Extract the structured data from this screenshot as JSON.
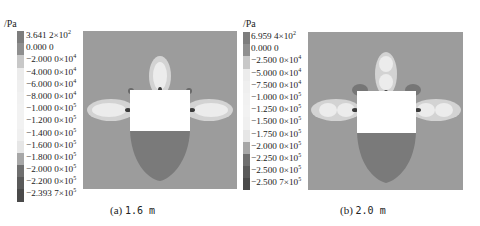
{
  "chart_data": [
    {
      "type": "heatmap",
      "title": "(a) 1.6 m",
      "caption_label": "(a)",
      "caption_value": "1.6 m",
      "unit": "/Pa",
      "legend_position": "left",
      "legend": [
        {
          "mantissa": "3.641 2",
          "exp": "2",
          "sci": true
        },
        {
          "mantissa": "0.000 0",
          "exp": null,
          "sci": false
        },
        {
          "mantissa": "−2.000 0",
          "exp": "4",
          "sci": true
        },
        {
          "mantissa": "−4.000 0",
          "exp": "4",
          "sci": true
        },
        {
          "mantissa": "−6.000 0",
          "exp": "4",
          "sci": true
        },
        {
          "mantissa": "−8.000 0",
          "exp": "4",
          "sci": true
        },
        {
          "mantissa": "−1.000 0",
          "exp": "5",
          "sci": true
        },
        {
          "mantissa": "−1.200 0",
          "exp": "5",
          "sci": true
        },
        {
          "mantissa": "−1.400 0",
          "exp": "5",
          "sci": true
        },
        {
          "mantissa": "−1.600 0",
          "exp": "5",
          "sci": true
        },
        {
          "mantissa": "−1.800 0",
          "exp": "5",
          "sci": true
        },
        {
          "mantissa": "−2.000 0",
          "exp": "5",
          "sci": true
        },
        {
          "mantissa": "−2.200 0",
          "exp": "5",
          "sci": true
        },
        {
          "mantissa": "−2.393 7",
          "exp": "5",
          "sci": true
        }
      ],
      "values_pa": [
        364.12,
        0,
        -20000,
        -40000,
        -60000,
        -80000,
        -100000,
        -120000,
        -140000,
        -160000,
        -180000,
        -200000,
        -220000,
        -239370
      ],
      "range": [
        -239370,
        364.12
      ]
    },
    {
      "type": "heatmap",
      "title": "(b) 2.0 m",
      "caption_label": "(b)",
      "caption_value": "2.0 m",
      "unit": "/Pa",
      "legend_position": "left",
      "legend": [
        {
          "mantissa": "6.959 4",
          "exp": "2",
          "sci": true
        },
        {
          "mantissa": "0.000 0",
          "exp": null,
          "sci": false
        },
        {
          "mantissa": "−2.500 0",
          "exp": "4",
          "sci": true
        },
        {
          "mantissa": "−5.000 0",
          "exp": "4",
          "sci": true
        },
        {
          "mantissa": "−7.500 0",
          "exp": "4",
          "sci": true
        },
        {
          "mantissa": "−1.000 0",
          "exp": "5",
          "sci": true
        },
        {
          "mantissa": "−1.250 0",
          "exp": "5",
          "sci": true
        },
        {
          "mantissa": "−1.500 0",
          "exp": "5",
          "sci": true
        },
        {
          "mantissa": "−1.750 0",
          "exp": "5",
          "sci": true
        },
        {
          "mantissa": "−2.000 0",
          "exp": "5",
          "sci": true
        },
        {
          "mantissa": "−2.250 0",
          "exp": "5",
          "sci": true
        },
        {
          "mantissa": "−2.500 0",
          "exp": "5",
          "sci": true
        },
        {
          "mantissa": "−2.500 7",
          "exp": "5",
          "sci": true
        }
      ],
      "values_pa": [
        695.94,
        0,
        -25000,
        -50000,
        -75000,
        -100000,
        -125000,
        -150000,
        -175000,
        -200000,
        -225000,
        -250000,
        -250070
      ],
      "range": [
        -250070,
        695.94
      ]
    }
  ],
  "colors": {
    "background_field": "#9c9c9c",
    "opening": "#ffffff",
    "lower_zone": "#7a7a7a",
    "plume_light": "#e8e8e8",
    "plume_mid": "#cfcfcf",
    "dark_core": "#3a3a3a",
    "cbar_a": [
      "#7d7d7d",
      "#8f8f8f",
      "#c8c8c8",
      "#ececec",
      "#efefef",
      "#f1f1f1",
      "#f2f2f2",
      "#f2f2f2",
      "#f0f0f0",
      "#e6e6e6",
      "#a7a7a7",
      "#6f6f6f",
      "#5a5a5a",
      "#4a4a4a"
    ],
    "cbar_b": [
      "#7d7d7d",
      "#8f8f8f",
      "#c8c8c8",
      "#ececec",
      "#efefef",
      "#f1f1f1",
      "#f2f2f2",
      "#f0f0f0",
      "#e6e6e6",
      "#a7a7a7",
      "#6f6f6f",
      "#5a5a5a",
      "#4a4a4a"
    ]
  }
}
